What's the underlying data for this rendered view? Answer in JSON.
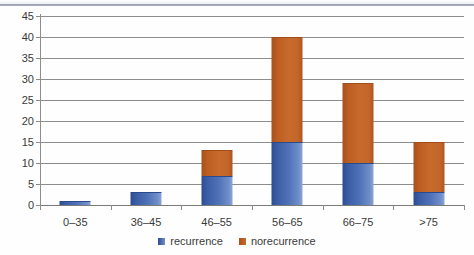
{
  "chart_data": {
    "type": "bar",
    "stacked": true,
    "title": "",
    "subtitle": "",
    "xlabel": "",
    "ylabel": "",
    "categories": [
      "0–35",
      "36–45",
      "46–55",
      "56–65",
      "66–75",
      ">75"
    ],
    "series": [
      {
        "name": "recurrence",
        "color": "#3B5EA8",
        "values": [
          1,
          3,
          7,
          15,
          10,
          3
        ]
      },
      {
        "name": "norecurrence",
        "color": "#BE5D23",
        "values": [
          0,
          0,
          6,
          25,
          19,
          12
        ]
      }
    ],
    "totals": [
      1,
      3,
      13,
      40,
      29,
      15
    ],
    "ylim": [
      0,
      45
    ],
    "ytick_step": 5,
    "yticks": [
      45,
      40,
      35,
      30,
      25,
      20,
      15,
      10,
      5,
      0
    ],
    "grid": true,
    "legend_position": "bottom-center",
    "legend": [
      "recurrence",
      "norecurrence"
    ]
  },
  "legend": {
    "items": [
      {
        "label": "recurrence"
      },
      {
        "label": "norecurrence"
      }
    ]
  }
}
